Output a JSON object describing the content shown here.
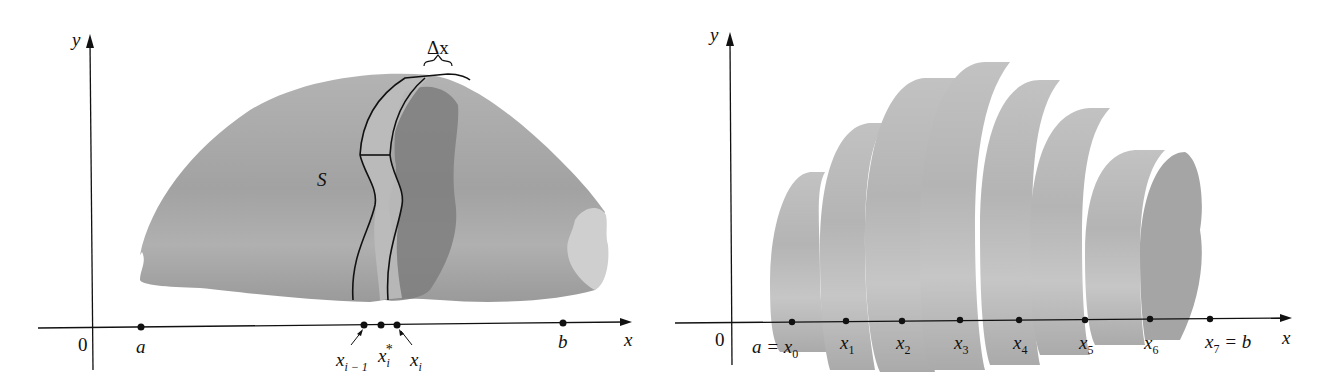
{
  "left_figure": {
    "y_axis_label": "y",
    "x_axis_label": "x",
    "origin_label": "0",
    "solid_label": "S",
    "slab_width_label": "Δx",
    "points": [
      {
        "label": "a"
      },
      {
        "label": "x",
        "sub": "i − 1"
      },
      {
        "label": "x",
        "sub": "i",
        "sup": "*"
      },
      {
        "label": "x",
        "sub": "i"
      },
      {
        "label": "b"
      }
    ]
  },
  "right_figure": {
    "y_axis_label": "y",
    "x_axis_label": "x",
    "origin_label": "0",
    "points": [
      {
        "prefix": "a = ",
        "label": "x",
        "sub": "0"
      },
      {
        "label": "x",
        "sub": "1"
      },
      {
        "label": "x",
        "sub": "2"
      },
      {
        "label": "x",
        "sub": "3"
      },
      {
        "label": "x",
        "sub": "4"
      },
      {
        "label": "x",
        "sub": "5"
      },
      {
        "label": "x",
        "sub": "6"
      },
      {
        "label": "x",
        "sub": "7",
        "suffix": " = b"
      }
    ]
  },
  "colors": {
    "solid_fill": "#a9a9a9",
    "slab_dark": "#7f7f7f",
    "slab_light": "#c4c4c4",
    "cylinder_fill": "#b8b8b8",
    "axis": "#111111"
  }
}
